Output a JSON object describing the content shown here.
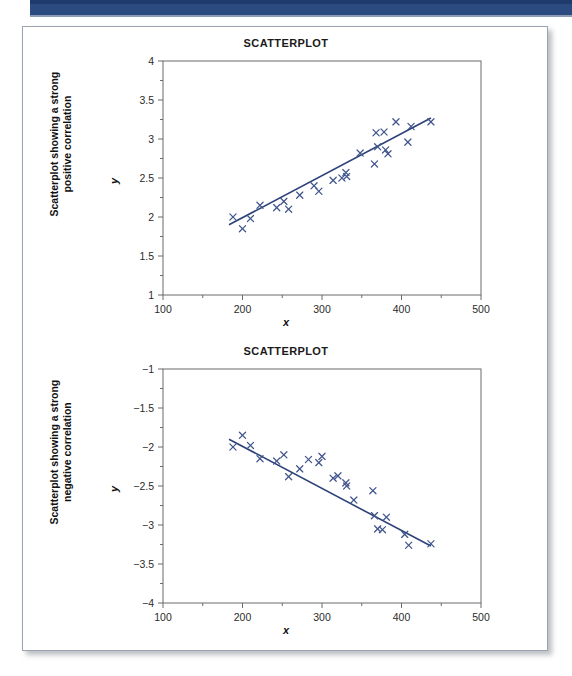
{
  "page": {
    "header_bar_color": "#2a4a80",
    "panel_border_color": "#9aa3b0",
    "ink_color": "#41558c"
  },
  "charts": [
    {
      "id": "top",
      "title": "SCATTERPLOT",
      "caption": "Scatterplot showing a strong\npositive correlation",
      "ylabel": "y",
      "xlabel": "x"
    },
    {
      "id": "bottom",
      "title": "SCATTERPLOT",
      "caption": "Scatterplot showing a strong\nnegative correlation",
      "ylabel": "y",
      "xlabel": "x"
    }
  ],
  "chart_data": [
    {
      "type": "scatter",
      "title": "SCATTERPLOT",
      "subtitle": "Scatterplot showing a strong positive correlation",
      "xlabel": "x",
      "ylabel": "y",
      "xlim": [
        100,
        500
      ],
      "ylim": [
        1,
        4
      ],
      "xticks": [
        100,
        200,
        300,
        400,
        500
      ],
      "xticklabels": [
        "100",
        "200",
        "300",
        "400",
        "500"
      ],
      "xminorticks": [
        150,
        250,
        350,
        450
      ],
      "yticks": [
        1,
        1.5,
        2,
        2.5,
        3,
        3.5,
        4
      ],
      "yticklabels": [
        "1",
        "1.5",
        "2",
        "2.5",
        "3",
        "3.5",
        "4"
      ],
      "yminorticks": [
        1.25,
        1.75,
        2.25,
        2.75,
        3.25,
        3.75
      ],
      "grid": false,
      "legend": false,
      "marker": "x",
      "marker_color": "#41558c",
      "points": [
        {
          "x": 188,
          "y": 2.0
        },
        {
          "x": 200,
          "y": 1.85
        },
        {
          "x": 210,
          "y": 1.98
        },
        {
          "x": 222,
          "y": 2.15
        },
        {
          "x": 243,
          "y": 2.12
        },
        {
          "x": 252,
          "y": 2.2
        },
        {
          "x": 258,
          "y": 2.1
        },
        {
          "x": 272,
          "y": 2.28
        },
        {
          "x": 290,
          "y": 2.4
        },
        {
          "x": 296,
          "y": 2.33
        },
        {
          "x": 314,
          "y": 2.47
        },
        {
          "x": 325,
          "y": 2.5
        },
        {
          "x": 330,
          "y": 2.57
        },
        {
          "x": 331,
          "y": 2.52
        },
        {
          "x": 348,
          "y": 2.82
        },
        {
          "x": 366,
          "y": 2.68
        },
        {
          "x": 368,
          "y": 3.08
        },
        {
          "x": 370,
          "y": 2.9
        },
        {
          "x": 378,
          "y": 3.09
        },
        {
          "x": 380,
          "y": 2.86
        },
        {
          "x": 383,
          "y": 2.81
        },
        {
          "x": 393,
          "y": 3.22
        },
        {
          "x": 408,
          "y": 2.96
        },
        {
          "x": 412,
          "y": 3.16
        },
        {
          "x": 437,
          "y": 3.22
        }
      ],
      "trendline": {
        "x_start": 183,
        "y_start": 1.9,
        "x_end": 437,
        "y_end": 3.27,
        "color": "#2d4278"
      }
    },
    {
      "type": "scatter",
      "title": "SCATTERPLOT",
      "subtitle": "Scatterplot showing a strong negative correlation",
      "xlabel": "x",
      "ylabel": "y",
      "xlim": [
        100,
        500
      ],
      "ylim": [
        -4,
        -1
      ],
      "xticks": [
        100,
        200,
        300,
        400,
        500
      ],
      "xticklabels": [
        "100",
        "200",
        "300",
        "400",
        "500"
      ],
      "xminorticks": [
        150,
        250,
        350,
        450
      ],
      "yticks": [
        -4,
        -3.5,
        -3,
        -2.5,
        -2,
        -1.5,
        -1
      ],
      "yticklabels": [
        "−4",
        "−3.5",
        "−3",
        "−2.5",
        "−2",
        "−1.5",
        "−1"
      ],
      "yminorticks": [
        -3.75,
        -3.25,
        -2.75,
        -2.25,
        -1.75,
        -1.25
      ],
      "grid": false,
      "legend": false,
      "marker": "x",
      "marker_color": "#41558c",
      "points": [
        {
          "x": 188,
          "y": -2.0
        },
        {
          "x": 200,
          "y": -1.85
        },
        {
          "x": 210,
          "y": -1.98
        },
        {
          "x": 222,
          "y": -2.15
        },
        {
          "x": 243,
          "y": -2.18
        },
        {
          "x": 252,
          "y": -2.1
        },
        {
          "x": 258,
          "y": -2.38
        },
        {
          "x": 272,
          "y": -2.28
        },
        {
          "x": 283,
          "y": -2.16
        },
        {
          "x": 296,
          "y": -2.2
        },
        {
          "x": 300,
          "y": -2.12
        },
        {
          "x": 314,
          "y": -2.4
        },
        {
          "x": 320,
          "y": -2.37
        },
        {
          "x": 330,
          "y": -2.46
        },
        {
          "x": 331,
          "y": -2.5
        },
        {
          "x": 340,
          "y": -2.68
        },
        {
          "x": 364,
          "y": -2.56
        },
        {
          "x": 366,
          "y": -2.88
        },
        {
          "x": 370,
          "y": -3.05
        },
        {
          "x": 376,
          "y": -3.06
        },
        {
          "x": 381,
          "y": -2.9
        },
        {
          "x": 404,
          "y": -3.12
        },
        {
          "x": 409,
          "y": -3.26
        },
        {
          "x": 437,
          "y": -3.24
        }
      ],
      "trendline": {
        "x_start": 183,
        "y_start": -1.9,
        "x_end": 437,
        "y_end": -3.27,
        "color": "#2d4278"
      }
    }
  ]
}
